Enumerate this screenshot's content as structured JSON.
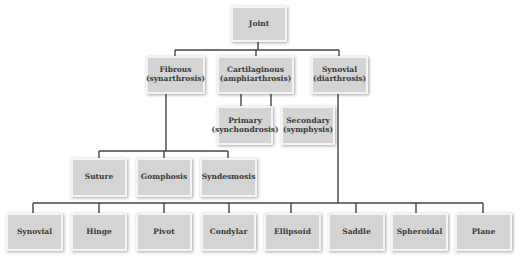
{
  "diagram": {
    "title": "Joint",
    "colors": {
      "box_fill": "#d4d4d4",
      "box_border": "#f4f4f4",
      "line": "#444444",
      "text": "#3a3a3a"
    },
    "nodes": {
      "joint": {
        "label": "Joint"
      },
      "fibrous": {
        "label": "Fibrous",
        "sub": "(synarthrosis)"
      },
      "cartilaginous": {
        "label": "Cartilaginous",
        "sub": "(amphiarthrosis)"
      },
      "synovial_class": {
        "label": "Synovial",
        "sub": "(diarthrosis)"
      },
      "primary": {
        "label": "Primary",
        "sub": "(synchondrosis)"
      },
      "secondary": {
        "label": "Secondary",
        "sub": "(symphysis)"
      },
      "suture": {
        "label": "Suture"
      },
      "gomphosis": {
        "label": "Gomphosis"
      },
      "syndesmosis": {
        "label": "Syndesmosis"
      },
      "synovial": {
        "label": "Synovial"
      },
      "hinge": {
        "label": "Hinge"
      },
      "pivot": {
        "label": "Pivot"
      },
      "condylar": {
        "label": "Condylar"
      },
      "ellipsoid": {
        "label": "Ellipsoid"
      },
      "saddle": {
        "label": "Saddle"
      },
      "spheroidal": {
        "label": "Spheroidal"
      },
      "plane": {
        "label": "Plane"
      }
    },
    "edges": [
      [
        "joint",
        "fibrous"
      ],
      [
        "joint",
        "cartilaginous"
      ],
      [
        "joint",
        "synovial_class"
      ],
      [
        "cartilaginous",
        "primary"
      ],
      [
        "cartilaginous",
        "secondary"
      ],
      [
        "fibrous",
        "suture"
      ],
      [
        "fibrous",
        "gomphosis"
      ],
      [
        "fibrous",
        "syndesmosis"
      ],
      [
        "synovial_class",
        "synovial"
      ],
      [
        "synovial_class",
        "hinge"
      ],
      [
        "synovial_class",
        "pivot"
      ],
      [
        "synovial_class",
        "condylar"
      ],
      [
        "synovial_class",
        "ellipsoid"
      ],
      [
        "synovial_class",
        "saddle"
      ],
      [
        "synovial_class",
        "spheroidal"
      ],
      [
        "synovial_class",
        "plane"
      ]
    ]
  }
}
